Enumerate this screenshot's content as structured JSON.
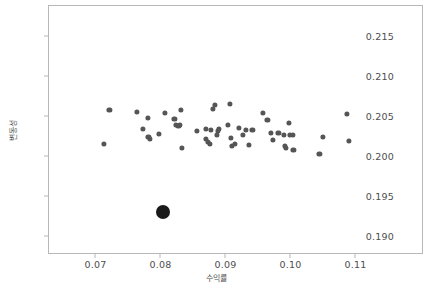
{
  "chart_data": {
    "type": "scatter",
    "title": "",
    "xlabel": "수익률",
    "ylabel": "변동성",
    "xlim": [
      0.0627,
      0.1204
    ],
    "ylim": [
      0.1878,
      0.2188
    ],
    "xticks": [
      0.07,
      0.08,
      0.09,
      0.1,
      0.11
    ],
    "xtick_labels": [
      "0.07",
      "0.08",
      "0.09",
      "0.10",
      "0.11"
    ],
    "yticks": [
      0.19,
      0.195,
      0.2,
      0.205,
      0.21,
      0.215
    ],
    "ytick_labels": [
      "0.190",
      "0.195",
      "0.200",
      "0.205",
      "0.210",
      "0.215"
    ],
    "grid": false,
    "legend": null,
    "series": [
      {
        "name": "portfolios",
        "color": "#555555",
        "marker": "circle",
        "marker_size": 5.2,
        "points": [
          [
            0.0712,
            0.20159
          ],
          [
            0.072,
            0.20584
          ],
          [
            0.0762,
            0.20559
          ],
          [
            0.0772,
            0.20354
          ],
          [
            0.0779,
            0.20491
          ],
          [
            0.078,
            0.20249
          ],
          [
            0.0782,
            0.20224
          ],
          [
            0.0796,
            0.20286
          ],
          [
            0.0805,
            0.20547
          ],
          [
            0.082,
            0.20472
          ],
          [
            0.0822,
            0.20398
          ],
          [
            0.0826,
            0.20386
          ],
          [
            0.0828,
            0.20398
          ],
          [
            0.083,
            0.20584
          ],
          [
            0.0831,
            0.20112
          ],
          [
            0.0854,
            0.2033
          ],
          [
            0.0868,
            0.20349
          ],
          [
            0.0869,
            0.20224
          ],
          [
            0.0872,
            0.20187
          ],
          [
            0.0874,
            0.20162
          ],
          [
            0.0876,
            0.20336
          ],
          [
            0.0879,
            0.20597
          ],
          [
            0.0882,
            0.20646
          ],
          [
            0.0885,
            0.20274
          ],
          [
            0.0887,
            0.20323
          ],
          [
            0.0889,
            0.20349
          ],
          [
            0.0902,
            0.20398
          ],
          [
            0.0905,
            0.20659
          ],
          [
            0.0907,
            0.20236
          ],
          [
            0.0909,
            0.20137
          ],
          [
            0.0913,
            0.20162
          ],
          [
            0.0919,
            0.20361
          ],
          [
            0.0925,
            0.20274
          ],
          [
            0.093,
            0.20336
          ],
          [
            0.0935,
            0.20149
          ],
          [
            0.094,
            0.20336
          ],
          [
            0.0956,
            0.20547
          ],
          [
            0.0963,
            0.2046
          ],
          [
            0.0968,
            0.20299
          ],
          [
            0.0972,
            0.20212
          ],
          [
            0.098,
            0.20299
          ],
          [
            0.0988,
            0.20274
          ],
          [
            0.099,
            0.20137
          ],
          [
            0.0992,
            0.20112
          ],
          [
            0.0996,
            0.20422
          ],
          [
            0.0998,
            0.20274
          ],
          [
            0.1002,
            0.20274
          ],
          [
            0.1003,
            0.20087
          ],
          [
            0.1043,
            0.20037
          ],
          [
            0.1048,
            0.20249
          ],
          [
            0.1086,
            0.20534
          ],
          [
            0.1088,
            0.20199
          ]
        ]
      },
      {
        "name": "optimal-portfolio",
        "color": "#1a1a1a",
        "marker": "circle",
        "marker_size": 14,
        "points": [
          [
            0.0803,
            0.19313
          ]
        ]
      }
    ]
  }
}
